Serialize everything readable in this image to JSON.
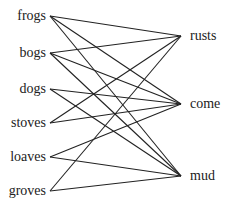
{
  "diagram": {
    "type": "bipartite-matching",
    "line_color": "#222222",
    "left_words": [
      {
        "id": "frogs",
        "label": "frogs",
        "x": 50,
        "y": 16
      },
      {
        "id": "bogs",
        "label": "bogs",
        "x": 50,
        "y": 53
      },
      {
        "id": "dogs",
        "label": "dogs",
        "x": 50,
        "y": 89
      },
      {
        "id": "stoves",
        "label": "stoves",
        "x": 50,
        "y": 123
      },
      {
        "id": "loaves",
        "label": "loaves",
        "x": 50,
        "y": 157
      },
      {
        "id": "groves",
        "label": "groves",
        "x": 50,
        "y": 191
      }
    ],
    "right_words": [
      {
        "id": "rusts",
        "label": "rusts",
        "x": 181,
        "y": 36
      },
      {
        "id": "come",
        "label": "come",
        "x": 181,
        "y": 104
      },
      {
        "id": "mud",
        "label": "mud",
        "x": 181,
        "y": 176
      }
    ],
    "edges": [
      [
        "frogs",
        "rusts"
      ],
      [
        "frogs",
        "come"
      ],
      [
        "frogs",
        "mud"
      ],
      [
        "bogs",
        "rusts"
      ],
      [
        "bogs",
        "come"
      ],
      [
        "bogs",
        "mud"
      ],
      [
        "dogs",
        "come"
      ],
      [
        "dogs",
        "mud"
      ],
      [
        "stoves",
        "rusts"
      ],
      [
        "stoves",
        "come"
      ],
      [
        "loaves",
        "come"
      ],
      [
        "loaves",
        "mud"
      ],
      [
        "groves",
        "rusts"
      ],
      [
        "groves",
        "mud"
      ]
    ]
  }
}
